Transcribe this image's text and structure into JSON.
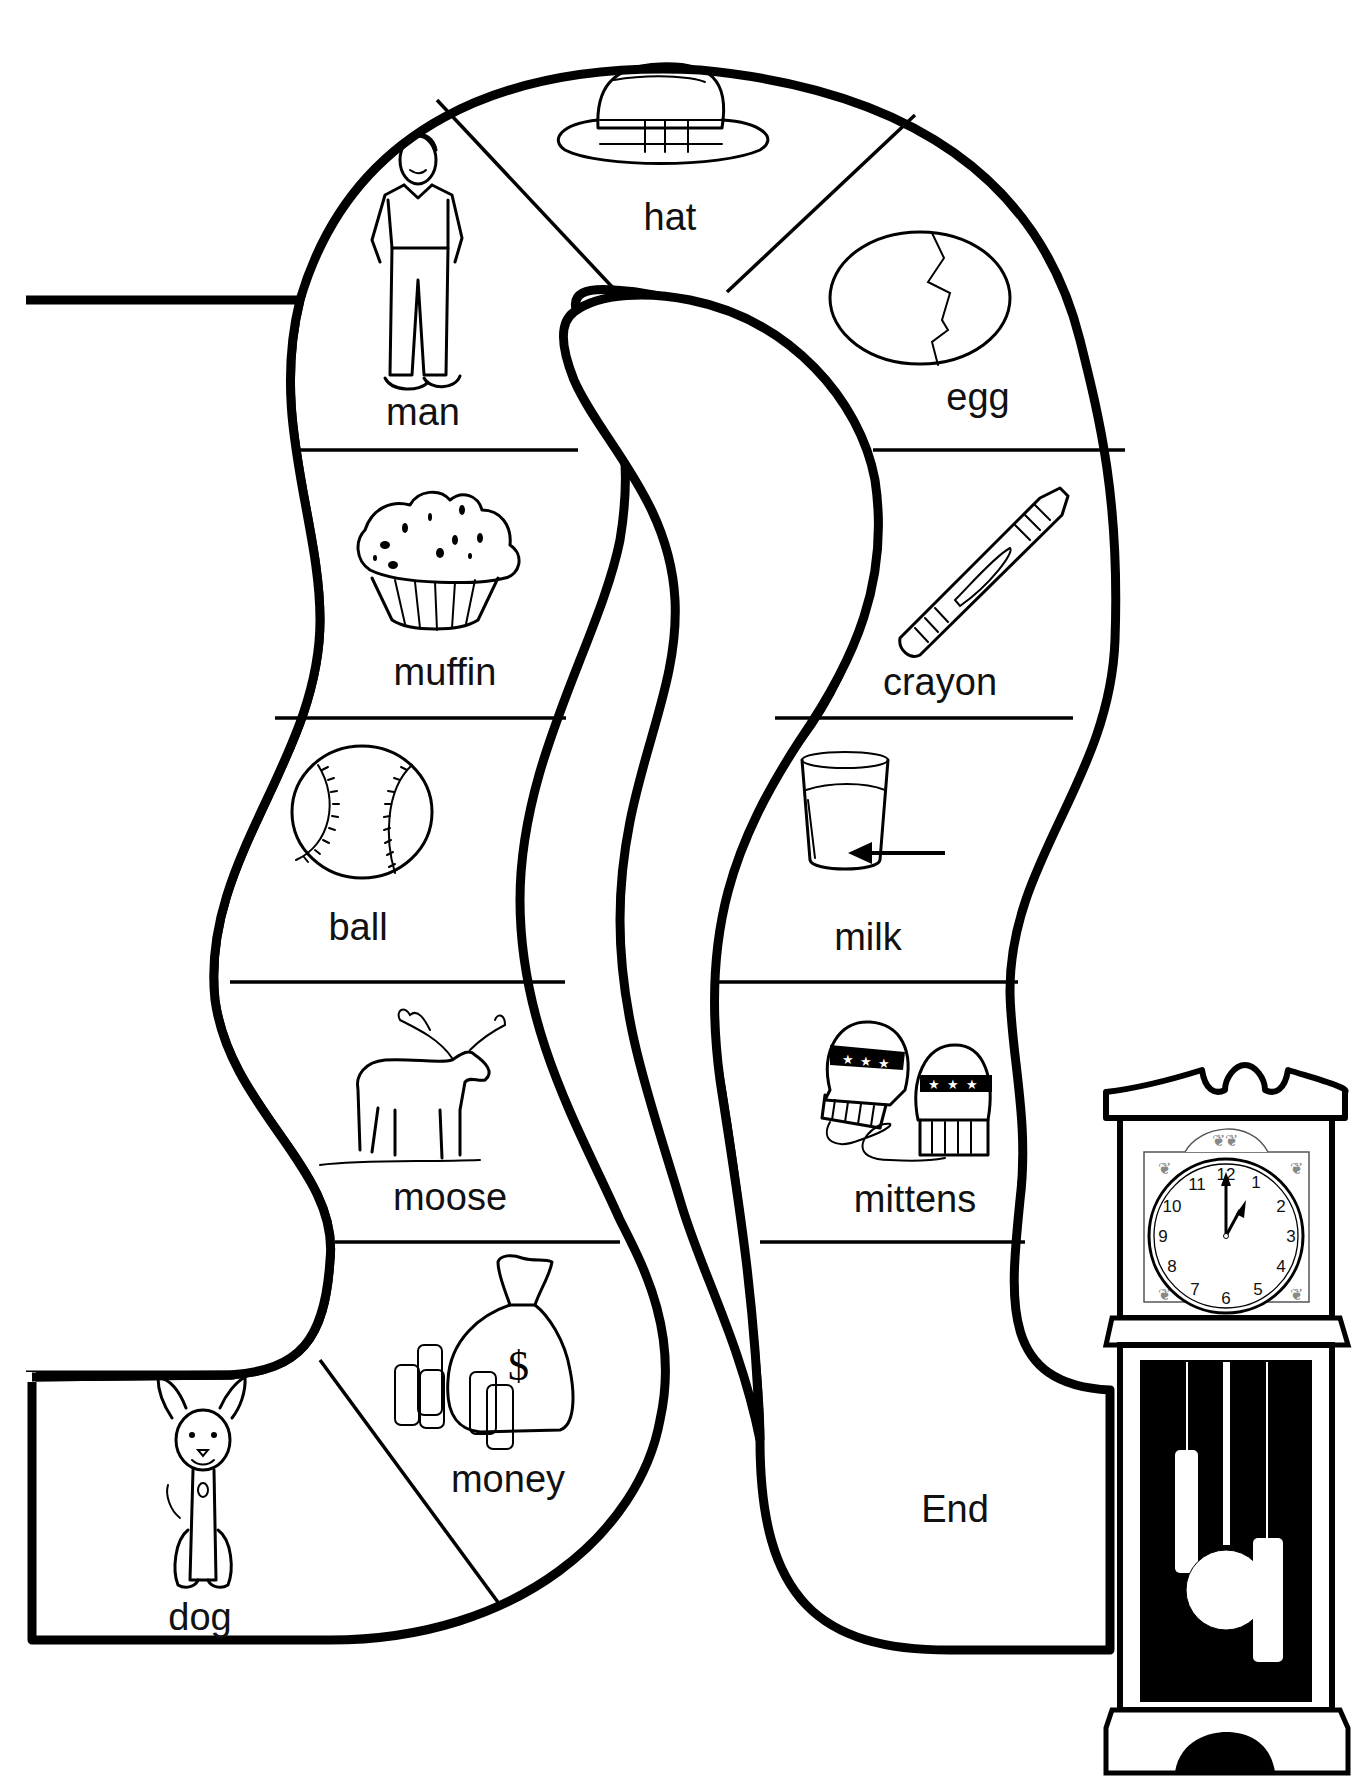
{
  "board": {
    "title": "",
    "background": "#ffffff",
    "line_color": "#000000",
    "spaces": [
      {
        "id": "dog",
        "label": "dog",
        "icon": "dog-icon",
        "order": 1
      },
      {
        "id": "money",
        "label": "money",
        "icon": "money-bag-icon",
        "order": 2
      },
      {
        "id": "moose",
        "label": "moose",
        "icon": "moose-icon",
        "order": 3
      },
      {
        "id": "ball",
        "label": "ball",
        "icon": "baseball-icon",
        "order": 4
      },
      {
        "id": "muffin",
        "label": "muffin",
        "icon": "muffin-icon",
        "order": 5
      },
      {
        "id": "man",
        "label": "man",
        "icon": "man-icon",
        "order": 6
      },
      {
        "id": "hat",
        "label": "hat",
        "icon": "hat-icon",
        "order": 7
      },
      {
        "id": "egg",
        "label": "egg",
        "icon": "egg-icon",
        "order": 8
      },
      {
        "id": "crayon",
        "label": "crayon",
        "icon": "crayon-icon",
        "order": 9
      },
      {
        "id": "milk",
        "label": "milk",
        "icon": "milk-glass-icon",
        "order": 10
      },
      {
        "id": "mittens",
        "label": "mittens",
        "icon": "mittens-icon",
        "order": 11
      },
      {
        "id": "end",
        "label": "End",
        "icon": "",
        "order": 12
      }
    ]
  },
  "clock": {
    "icon": "grandfather-clock-icon",
    "numbers": [
      "12",
      "1",
      "2",
      "3",
      "4",
      "5",
      "6",
      "7",
      "8",
      "9",
      "10",
      "11"
    ],
    "time_shown": "1:00"
  }
}
